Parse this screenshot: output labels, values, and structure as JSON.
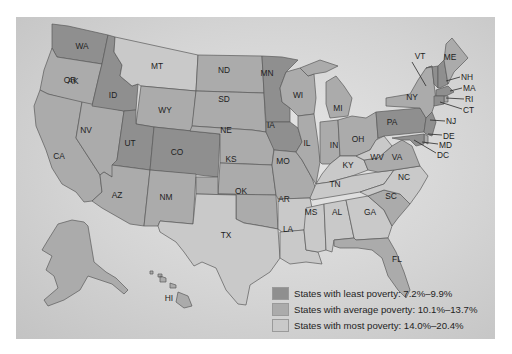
{
  "map": {
    "title": "US States by Poverty Rate",
    "colors": {
      "least": "#8f8f8f",
      "average": "#ababab",
      "most": "#c9c9c9",
      "background": "#d4d4d4"
    },
    "states": {
      "WA": "WA",
      "OR": "OR",
      "CA": "CA",
      "NV": "NV",
      "ID": "ID",
      "MT": "MT",
      "WY": "WY",
      "UT": "UT",
      "AZ": "AZ",
      "CO": "CO",
      "NM": "NM",
      "ND": "ND",
      "SD": "SD",
      "NE": "NE",
      "KS": "KS",
      "OK": "OK",
      "TX": "TX",
      "MN": "MN",
      "IA": "IA",
      "MO": "MO",
      "AR": "AR",
      "LA": "LA",
      "WI": "WI",
      "IL": "IL",
      "MI": "MI",
      "IN": "IN",
      "OH": "OH",
      "KY": "KY",
      "TN": "TN",
      "MS": "MS",
      "AL": "AL",
      "GA": "GA",
      "FL": "FL",
      "SC": "SC",
      "NC": "NC",
      "VA": "VA",
      "WV": "WV",
      "PA": "PA",
      "NY": "NY",
      "VT": "VT",
      "ME": "ME",
      "NH": "NH",
      "MA": "MA",
      "RI": "RI",
      "CT": "CT",
      "NJ": "NJ",
      "DE": "DE",
      "MD": "MD",
      "DC": "DC",
      "AK": "AK",
      "HI": "HI"
    }
  },
  "legend": {
    "items": [
      {
        "label": "States with least poverty: 7.2%–9.9%",
        "category": "least"
      },
      {
        "label": "States with average poverty: 10.1%–13.7%",
        "category": "average"
      },
      {
        "label": "States with most poverty: 14.0%–20.4%",
        "category": "most"
      }
    ]
  }
}
